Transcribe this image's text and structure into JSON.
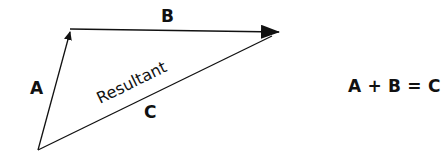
{
  "diagram": {
    "vectors": [
      {
        "id": "A",
        "label": "A",
        "from": [
          38,
          150
        ],
        "to": [
          71,
          29
        ]
      },
      {
        "id": "B",
        "label": "B",
        "from": [
          71,
          29
        ],
        "to": [
          280,
          32
        ]
      },
      {
        "id": "C",
        "label": "C",
        "caption": "Resultant",
        "from": [
          38,
          150
        ],
        "to": [
          280,
          32
        ]
      }
    ],
    "labels": {
      "a": "A",
      "b": "B",
      "c": "C",
      "resultant": "Resultant"
    },
    "equation": "A + B = C",
    "colors": {
      "stroke": "#111111",
      "background": "#ffffff"
    }
  }
}
